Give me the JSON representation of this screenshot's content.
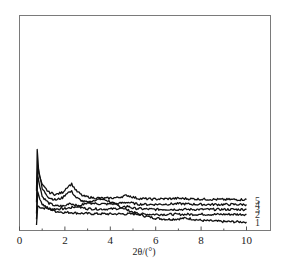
{
  "chart_data": {
    "type": "line",
    "title": "",
    "xlabel": "2θ/(°)",
    "ylabel": "",
    "xlim": [
      0,
      11
    ],
    "xticks": [
      0,
      2,
      4,
      6,
      8,
      10
    ],
    "xtick_labels": [
      "0",
      "2",
      "4",
      "6",
      "8",
      "10"
    ],
    "minor_xticks": [
      1,
      3,
      5,
      7,
      9
    ],
    "grid": false,
    "legend": "inline labels at right end of each curve",
    "series": [
      {
        "name": "1",
        "x": [
          0.75,
          0.8,
          1.0,
          1.5,
          2.0,
          2.5,
          3.0,
          3.3,
          3.6,
          3.9,
          4.3,
          4.8,
          5.5,
          6.0,
          6.5,
          7.0,
          7.3,
          7.6,
          8.0,
          9.0,
          10.0
        ],
        "y": [
          0.0,
          0.5,
          0.45,
          0.42,
          0.43,
          0.48,
          0.58,
          0.66,
          0.68,
          0.64,
          0.52,
          0.38,
          0.24,
          0.18,
          0.15,
          0.16,
          0.18,
          0.16,
          0.12,
          0.09,
          0.08
        ]
      },
      {
        "name": "2",
        "x": [
          0.75,
          0.8,
          1.0,
          1.3,
          1.6,
          2.0,
          2.3,
          2.6,
          3.0,
          4.0,
          5.0,
          6.0,
          7.0,
          8.0,
          9.0,
          10.0
        ],
        "y": [
          0.15,
          0.85,
          0.55,
          0.42,
          0.36,
          0.33,
          0.33,
          0.31,
          0.3,
          0.29,
          0.29,
          0.28,
          0.28,
          0.28,
          0.28,
          0.28
        ]
      },
      {
        "name": "3",
        "x": [
          0.75,
          0.8,
          1.0,
          1.3,
          1.6,
          2.0,
          2.2,
          2.4,
          2.7,
          3.0,
          3.5,
          4.0,
          4.5,
          4.75,
          5.0,
          5.5,
          6.0,
          7.0,
          8.0,
          9.0,
          10.0
        ],
        "y": [
          0.3,
          1.3,
          0.75,
          0.57,
          0.5,
          0.5,
          0.58,
          0.54,
          0.46,
          0.43,
          0.42,
          0.42,
          0.44,
          0.5,
          0.44,
          0.42,
          0.41,
          0.41,
          0.41,
          0.41,
          0.41
        ]
      },
      {
        "name": "4",
        "x": [
          0.75,
          0.8,
          1.0,
          1.3,
          1.6,
          1.9,
          2.1,
          2.3,
          2.5,
          2.8,
          3.2,
          3.8,
          4.3,
          4.75,
          5.2,
          5.8,
          6.5,
          7.0,
          8.0,
          9.0,
          10.0
        ],
        "y": [
          0.6,
          1.6,
          0.95,
          0.72,
          0.66,
          0.72,
          0.85,
          0.88,
          0.72,
          0.62,
          0.57,
          0.55,
          0.56,
          0.6,
          0.55,
          0.54,
          0.55,
          0.56,
          0.54,
          0.54,
          0.54
        ]
      },
      {
        "name": "5",
        "x": [
          0.75,
          0.78,
          0.85,
          1.0,
          1.3,
          1.6,
          1.9,
          2.1,
          2.3,
          2.5,
          2.8,
          3.2,
          3.8,
          4.3,
          4.75,
          5.2,
          5.8,
          6.5,
          7.0,
          8.0,
          9.0,
          10.0
        ],
        "y": [
          0.9,
          2.0,
          1.35,
          1.05,
          0.86,
          0.8,
          0.86,
          1.0,
          1.08,
          0.9,
          0.76,
          0.72,
          0.7,
          0.72,
          0.78,
          0.7,
          0.68,
          0.69,
          0.7,
          0.68,
          0.67,
          0.67
        ]
      }
    ]
  },
  "labels": {
    "x_axis": "2θ/(°)",
    "curve_labels": [
      "1",
      "2",
      "3",
      "4",
      "5"
    ],
    "xtick_labels": [
      "0",
      "2",
      "4",
      "6",
      "8",
      "10"
    ]
  }
}
